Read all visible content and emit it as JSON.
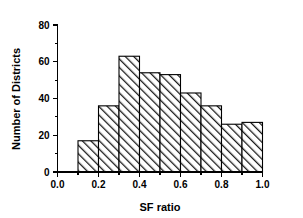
{
  "chart_data": {
    "type": "bar",
    "title": "",
    "subtitle": "",
    "xlabel": "SF ratio",
    "ylabel": "Number of Districts",
    "xlim": [
      0.0,
      1.0
    ],
    "ylim": [
      0,
      80
    ],
    "grid": false,
    "legend": null,
    "bin_edges": [
      0.1,
      0.2,
      0.3,
      0.4,
      0.5,
      0.6,
      0.7,
      0.8,
      0.9,
      1.0
    ],
    "categories": [
      "0.1-0.2",
      "0.2-0.3",
      "0.3-0.4",
      "0.4-0.5",
      "0.5-0.6",
      "0.6-0.7",
      "0.7-0.8",
      "0.8-0.9",
      "0.9-1.0"
    ],
    "values": [
      17,
      36,
      63,
      54,
      53,
      43,
      36,
      26,
      27
    ],
    "x_tick_labels": [
      "0.0",
      "0.2",
      "0.4",
      "0.6",
      "0.8",
      "1.0"
    ],
    "x_tick_values": [
      0.0,
      0.2,
      0.4,
      0.6,
      0.8,
      1.0
    ],
    "x_minor_tick_values": [
      0.1,
      0.3,
      0.5,
      0.7,
      0.9
    ],
    "y_tick_labels": [
      "0",
      "20",
      "40",
      "60",
      "80"
    ],
    "y_tick_values": [
      0,
      20,
      40,
      60,
      80
    ],
    "y_minor_tick_values": [
      10,
      30,
      50,
      70
    ],
    "bar_fill_pattern": "diagonal-hatch",
    "bar_edge_color": "#000000",
    "bar_fill_color": "#ffffff",
    "background_color": "#ffffff"
  }
}
